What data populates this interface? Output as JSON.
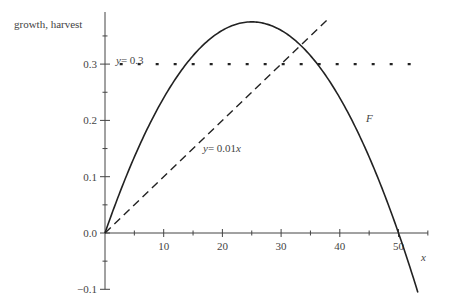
{
  "chart_data": {
    "type": "line",
    "title": "",
    "xlabel": "x",
    "ylabel": "growth, harvest",
    "xlim": [
      0,
      55
    ],
    "ylim": [
      -0.1,
      0.38
    ],
    "x_ticks": [
      10,
      20,
      30,
      40,
      50
    ],
    "x_minor_ticks": [
      5,
      15,
      25,
      35,
      45,
      55
    ],
    "y_ticks": [
      -0.1,
      0.0,
      0.1,
      0.2,
      0.3
    ],
    "y_tick_labels": [
      "−0.1",
      "0.0",
      "0.1",
      "0.2",
      "0.3"
    ],
    "grid": false,
    "legend": null,
    "series": [
      {
        "name": "F",
        "style": "solid",
        "formula": "0.03*x*(1 - x/50)",
        "x": [
          0,
          5,
          10,
          15,
          20,
          25,
          30,
          35,
          40,
          45,
          50,
          53.3
        ],
        "values": [
          0.0,
          0.135,
          0.24,
          0.315,
          0.36,
          0.375,
          0.36,
          0.315,
          0.24,
          0.135,
          0.0,
          -0.106
        ]
      },
      {
        "name": "y = 0.01x",
        "style": "dashed",
        "x": [
          0,
          38
        ],
        "values": [
          0.0,
          0.38
        ]
      },
      {
        "name": "y = 0.3",
        "style": "dotted",
        "x": [
          0,
          53
        ],
        "values": [
          0.3,
          0.3
        ]
      }
    ],
    "annotations": [
      {
        "text": "y = 0.3",
        "x": 3,
        "y": 0.31
      },
      {
        "text": "y = 0.01x",
        "x": 23,
        "y": 0.145
      },
      {
        "text": "F",
        "x": 45,
        "y": 0.2
      },
      {
        "text": "x",
        "x": 54,
        "y": -0.03
      }
    ]
  },
  "labels": {
    "ylabel": "growth, harvest",
    "xlabel": "x",
    "F": "F",
    "line_harvest": "= 0.01",
    "const_harvest": "= 0.3",
    "y": "y",
    "x": "x"
  }
}
